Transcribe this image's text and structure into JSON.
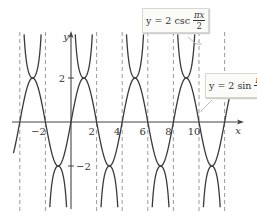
{
  "chart_data": {
    "type": "line",
    "title": "",
    "xlabel": "x",
    "ylabel": "y",
    "xlim": [
      -4.5,
      13.5
    ],
    "ylim": [
      -4,
      4
    ],
    "grid": false,
    "x_ticks": [
      {
        "value": -2,
        "label": "−2"
      },
      {
        "value": 2,
        "label": "2"
      },
      {
        "value": 4,
        "label": "4"
      },
      {
        "value": 6,
        "label": "6"
      },
      {
        "value": 8,
        "label": "8"
      },
      {
        "value": 10,
        "label": "10"
      }
    ],
    "y_ticks": [
      {
        "value": 2,
        "label": "2"
      },
      {
        "value": -2,
        "label": "−2"
      }
    ],
    "asymptotes_x": [
      -4,
      -2,
      0,
      2,
      4,
      6,
      8,
      10,
      12
    ],
    "series": [
      {
        "name": "y = 2 csc(πx/2)",
        "function": "2/sin(pi*x/2)",
        "style": "solid",
        "color": "#3a3a3a"
      },
      {
        "name": "y = 2 sin(πx/2)",
        "function": "2*sin(pi*x/2)",
        "style": "solid",
        "color": "#3a3a3a"
      }
    ],
    "annotations": [
      {
        "text": "y = 2 csc πx/2",
        "points_to": "csc curve near x=11"
      },
      {
        "text": "y = 2 sin πx/2",
        "points_to": "sin curve near x=11"
      }
    ]
  },
  "labels": {
    "x_axis": "x",
    "y_axis": "y",
    "csc_eq_prefix": "y = 2 csc",
    "sin_eq_prefix": "y = 2 sin",
    "frac_num": "πx",
    "frac_den": "2"
  },
  "colors": {
    "curve": "#3a3a3a",
    "axis": "#444444",
    "asymptote": "#9a9a9a"
  }
}
